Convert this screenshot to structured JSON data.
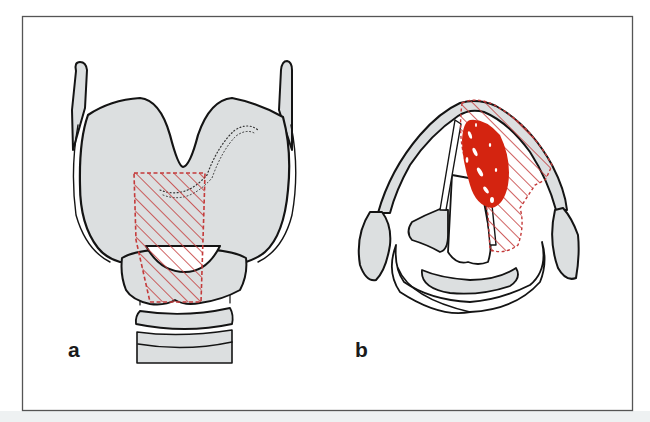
{
  "figure": {
    "panels": [
      {
        "id": "a",
        "label": "a",
        "view": "anterior view of larynx with hatched resection area"
      },
      {
        "id": "b",
        "label": "b",
        "view": "axial section of larynx with tumor and hatched resection area"
      }
    ],
    "colors": {
      "frame": "#555555",
      "cartilage_fill": "#dcdfe0",
      "outline": "#141414",
      "hatch": "#c43a3a",
      "tumor": "#d42410",
      "background": "#ffffff",
      "band": "#eef1f2"
    }
  }
}
